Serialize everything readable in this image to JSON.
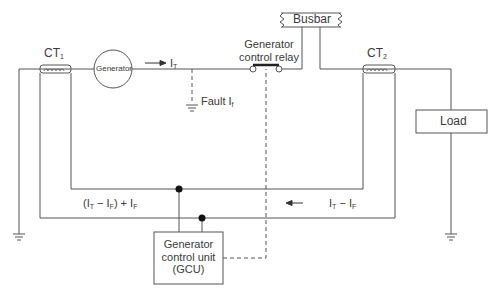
{
  "diagram": {
    "type": "electrical-schematic",
    "components": {
      "ct1": {
        "label": "CT",
        "sub": "1"
      },
      "ct2": {
        "label": "CT",
        "sub": "2"
      },
      "generator": {
        "label": "Generator"
      },
      "busbar": {
        "label": "Busbar"
      },
      "relay": {
        "line1": "Generator",
        "line2": "control relay"
      },
      "load": {
        "label": "Load"
      },
      "gcu": {
        "line1": "Generator",
        "line2": "control unit",
        "line3": "(GCU)"
      }
    },
    "labels": {
      "it": {
        "main": "I",
        "sub": "T"
      },
      "fault": {
        "text": "Fault I",
        "sub": "f"
      },
      "left_loop": {
        "p1": "(I",
        "s1": "T",
        "p2": " − I",
        "s2": "F",
        "p3": ") + I",
        "s3": "F"
      },
      "right_loop": {
        "p1": "I",
        "s1": "T",
        "p2": " − I",
        "s2": "F"
      }
    },
    "colors": {
      "line": "#555555",
      "text": "#3a3a3a"
    }
  }
}
